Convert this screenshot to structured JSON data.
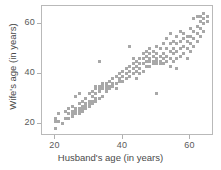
{
  "chart_data": {
    "type": "scatter",
    "title": "",
    "xlabel": "Husband's age (in years)",
    "ylabel": "Wife's age (in years)",
    "xlim": [
      16,
      67
    ],
    "ylim": [
      15,
      67
    ],
    "xticks": [
      20,
      40,
      60
    ],
    "yticks": [
      20,
      40,
      60
    ],
    "xtick_labels": [
      "20",
      "40",
      "60"
    ],
    "ytick_labels": [
      "20",
      "40",
      "60"
    ],
    "grid": false,
    "legend": null,
    "marker": "square",
    "marker_color": "#a8a8a8",
    "frame_color": "#b9b9b9",
    "series": [
      {
        "name": "couples",
        "points": [
          [
            20,
            18
          ],
          [
            20,
            21
          ],
          [
            20,
            22
          ],
          [
            21,
            21
          ],
          [
            21,
            24
          ],
          [
            22,
            20
          ],
          [
            23,
            22
          ],
          [
            23,
            25
          ],
          [
            24,
            22
          ],
          [
            24,
            24
          ],
          [
            24,
            26
          ],
          [
            25,
            23
          ],
          [
            25,
            24
          ],
          [
            25,
            25
          ],
          [
            25,
            27
          ],
          [
            26,
            24
          ],
          [
            26,
            25
          ],
          [
            26,
            26
          ],
          [
            26,
            31
          ],
          [
            27,
            24
          ],
          [
            27,
            25
          ],
          [
            27,
            26
          ],
          [
            27,
            28
          ],
          [
            27,
            32
          ],
          [
            28,
            25
          ],
          [
            28,
            26
          ],
          [
            28,
            27
          ],
          [
            28,
            29
          ],
          [
            29,
            26
          ],
          [
            29,
            27
          ],
          [
            29,
            28
          ],
          [
            29,
            30
          ],
          [
            30,
            27
          ],
          [
            30,
            28
          ],
          [
            30,
            29
          ],
          [
            30,
            32
          ],
          [
            31,
            28
          ],
          [
            31,
            29
          ],
          [
            31,
            31
          ],
          [
            31,
            33
          ],
          [
            32,
            29
          ],
          [
            32,
            30
          ],
          [
            32,
            32
          ],
          [
            32,
            34
          ],
          [
            32,
            35
          ],
          [
            33,
            30
          ],
          [
            33,
            33
          ],
          [
            33,
            34
          ],
          [
            33,
            35
          ],
          [
            33,
            45
          ],
          [
            34,
            31
          ],
          [
            34,
            34
          ],
          [
            34,
            35
          ],
          [
            34,
            36
          ],
          [
            35,
            33
          ],
          [
            35,
            34
          ],
          [
            35,
            35
          ],
          [
            35,
            36
          ],
          [
            36,
            34
          ],
          [
            36,
            35
          ],
          [
            36,
            35
          ],
          [
            36,
            37
          ],
          [
            37,
            35
          ],
          [
            37,
            36
          ],
          [
            37,
            38
          ],
          [
            38,
            34
          ],
          [
            38,
            36
          ],
          [
            38,
            39
          ],
          [
            39,
            37
          ],
          [
            39,
            38
          ],
          [
            39,
            40
          ],
          [
            40,
            37
          ],
          [
            40,
            39
          ],
          [
            40,
            41
          ],
          [
            41,
            38
          ],
          [
            41,
            40
          ],
          [
            41,
            42
          ],
          [
            42,
            39
          ],
          [
            42,
            41
          ],
          [
            42,
            43
          ],
          [
            42,
            51
          ],
          [
            43,
            40
          ],
          [
            43,
            42
          ],
          [
            43,
            44
          ],
          [
            43,
            46
          ],
          [
            44,
            38
          ],
          [
            44,
            41
          ],
          [
            44,
            43
          ],
          [
            44,
            45
          ],
          [
            45,
            40
          ],
          [
            45,
            42
          ],
          [
            45,
            44
          ],
          [
            45,
            46
          ],
          [
            46,
            41
          ],
          [
            46,
            44
          ],
          [
            46,
            46
          ],
          [
            46,
            48
          ],
          [
            47,
            43
          ],
          [
            47,
            45
          ],
          [
            47,
            47
          ],
          [
            47,
            49
          ],
          [
            48,
            43
          ],
          [
            48,
            45
          ],
          [
            48,
            46
          ],
          [
            48,
            48
          ],
          [
            48,
            50
          ],
          [
            49,
            44
          ],
          [
            49,
            45
          ],
          [
            49,
            47
          ],
          [
            49,
            49
          ],
          [
            50,
            32
          ],
          [
            50,
            44
          ],
          [
            50,
            45
          ],
          [
            50,
            46
          ],
          [
            50,
            48
          ],
          [
            50,
            51
          ],
          [
            51,
            44
          ],
          [
            51,
            45
          ],
          [
            51,
            47
          ],
          [
            51,
            50
          ],
          [
            52,
            44
          ],
          [
            52,
            46
          ],
          [
            52,
            48
          ],
          [
            52,
            52
          ],
          [
            53,
            45
          ],
          [
            53,
            47
          ],
          [
            53,
            50
          ],
          [
            53,
            54
          ],
          [
            54,
            43
          ],
          [
            54,
            46
          ],
          [
            54,
            49
          ],
          [
            54,
            52
          ],
          [
            54,
            56
          ],
          [
            55,
            45
          ],
          [
            55,
            48
          ],
          [
            55,
            50
          ],
          [
            55,
            53
          ],
          [
            56,
            42
          ],
          [
            56,
            46
          ],
          [
            56,
            49
          ],
          [
            56,
            52
          ],
          [
            56,
            55
          ],
          [
            57,
            47
          ],
          [
            57,
            50
          ],
          [
            57,
            53
          ],
          [
            57,
            57
          ],
          [
            58,
            48
          ],
          [
            58,
            51
          ],
          [
            58,
            54
          ],
          [
            58,
            56
          ],
          [
            59,
            46
          ],
          [
            59,
            50
          ],
          [
            59,
            53
          ],
          [
            59,
            55
          ],
          [
            60,
            49
          ],
          [
            60,
            52
          ],
          [
            60,
            55
          ],
          [
            60,
            58
          ],
          [
            61,
            51
          ],
          [
            61,
            54
          ],
          [
            61,
            57
          ],
          [
            61,
            62
          ],
          [
            62,
            53
          ],
          [
            62,
            56
          ],
          [
            62,
            59
          ],
          [
            62,
            63
          ],
          [
            63,
            55
          ],
          [
            63,
            58
          ],
          [
            63,
            61
          ],
          [
            63,
            63
          ],
          [
            64,
            57
          ],
          [
            64,
            60
          ],
          [
            64,
            62
          ],
          [
            64,
            64
          ],
          [
            65,
            61
          ],
          [
            65,
            63
          ]
        ]
      }
    ]
  },
  "axes": {
    "x_ticks": [
      {
        "value": 20,
        "label": "20"
      },
      {
        "value": 40,
        "label": "40"
      },
      {
        "value": 60,
        "label": "60"
      }
    ],
    "y_ticks": [
      {
        "value": 20,
        "label": "20"
      },
      {
        "value": 40,
        "label": "40"
      },
      {
        "value": 60,
        "label": "60"
      }
    ],
    "x_title": "Husband's age (in years)",
    "y_title": "Wife's age (in years)"
  }
}
